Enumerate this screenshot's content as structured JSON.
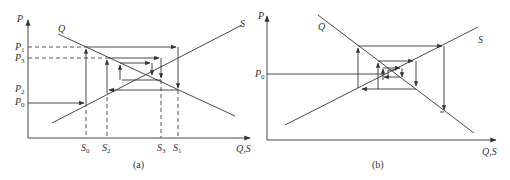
{
  "panel_a": {
    "caption": "(a)",
    "y_axis_label": "P",
    "x_axis_label": "Q,S",
    "curve_demand": "Q",
    "curve_supply": "S",
    "price_labels": [
      {
        "main": "P",
        "sub": "1"
      },
      {
        "main": "P",
        "sub": "3"
      },
      {
        "main": "P",
        "sub": "2"
      },
      {
        "main": "P",
        "sub": "0"
      }
    ],
    "quantity_labels": [
      {
        "main": "S",
        "sub": "0"
      },
      {
        "main": "S",
        "sub": "2"
      },
      {
        "main": "S",
        "sub": "3"
      },
      {
        "main": "S",
        "sub": "1"
      }
    ]
  },
  "panel_b": {
    "caption": "(b)",
    "y_axis_label": "P",
    "x_axis_label": "Q,S",
    "curve_demand": "Q",
    "curve_supply": "S",
    "price_labels": [
      {
        "main": "P",
        "sub": "0"
      }
    ]
  },
  "colors": {
    "line": "#333333",
    "dashed": "#444444"
  }
}
